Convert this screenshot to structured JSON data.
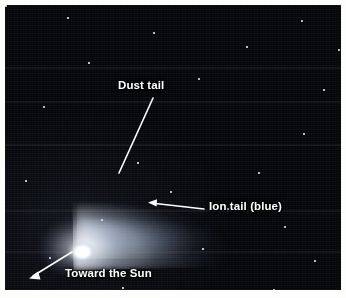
{
  "figure": {
    "kind": "annotated-astrophotograph",
    "border_color": "#fdfdfb",
    "sky_color": "#05060b",
    "label_color": "#ffffff"
  },
  "annotations": [
    {
      "id": "dust-tail",
      "label": "Dust tail",
      "leader": "line",
      "points_to": "broad curved fan of tail above the nucleus"
    },
    {
      "id": "ion-tail",
      "label": "Ion tail (blue)",
      "leader": "arrow",
      "points_to": "narrow faint straight tail extending to the right"
    },
    {
      "id": "toward-the-sun",
      "label": "Toward the Sun",
      "leader": "arrow",
      "points_to": "down-left, away from the nucleus"
    }
  ]
}
